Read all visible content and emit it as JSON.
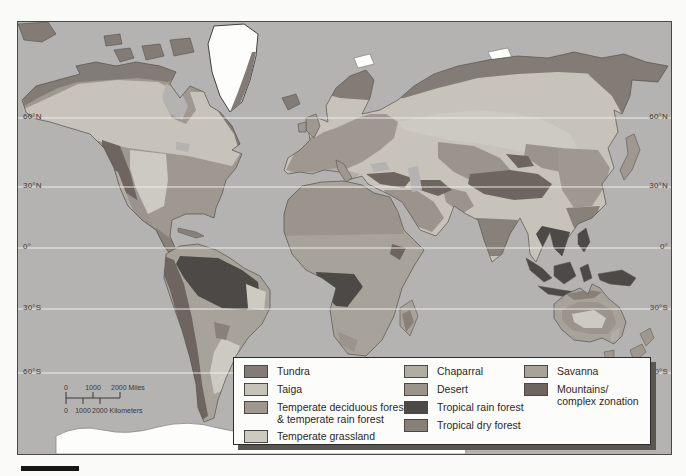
{
  "map": {
    "latitudes": [
      "60°N",
      "30°N",
      "0°",
      "30°S",
      "60°S"
    ]
  },
  "scale_bar": {
    "miles_0": "0",
    "miles_1000": "1000",
    "miles_2000": "2000 Miles",
    "km_0": "0",
    "km_1000": "1000",
    "km_2000": "2000 Kilometers"
  },
  "legend": {
    "columns": [
      {
        "items": [
          {
            "label": "Tundra"
          },
          {
            "label": "Taiga"
          },
          {
            "label": "Temperate deciduous forest",
            "label2": "& temperate rain forest"
          },
          {
            "label": "Temperate grassland"
          }
        ]
      },
      {
        "items": [
          {
            "label": "Chaparral"
          },
          {
            "label": "Desert"
          },
          {
            "label": "Tropical rain forest"
          },
          {
            "label": "Tropical dry forest"
          }
        ]
      },
      {
        "items": [
          {
            "label": "Savanna"
          },
          {
            "label": "Mountains/",
            "label2": "complex zonation"
          }
        ]
      }
    ]
  },
  "colors": {
    "ocean": "#b4b3b1",
    "ice": "#fdfdfc",
    "tundra": "#837b76",
    "taiga": "#c7c3ba",
    "temperate_deciduous": "#9e9890",
    "temperate_grassland": "#cdcac2",
    "chaparral": "#b2ada4",
    "desert": "#9a948c",
    "tropical_rain_forest": "#4d4946",
    "tropical_dry_forest": "#878179",
    "savanna": "#a8a39a",
    "mountains": "#6e6561",
    "coastline": "#55514d",
    "latitude_line": "#f2f1ee"
  }
}
